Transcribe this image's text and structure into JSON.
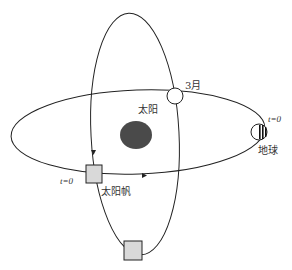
{
  "diagram": {
    "type": "orbit-diagram",
    "labels": {
      "march": "3月",
      "sun": "太阳",
      "t0_earth": "t=0",
      "earth": "地球",
      "t0_sail": "t=0",
      "solar_sail": "太阳帆"
    },
    "colors": {
      "sun": "#4a4a4a",
      "sail_box": "#d9d9d9",
      "orbit_line": "#222222",
      "earth_stripes": "#111111"
    },
    "elements": [
      {
        "name": "earth-orbit",
        "shape": "ellipse"
      },
      {
        "name": "sail-orbit",
        "shape": "ellipse"
      },
      {
        "name": "sun",
        "shape": "filled-ellipse"
      },
      {
        "name": "earth-march-position",
        "shape": "open-circle"
      },
      {
        "name": "earth-t0-position",
        "shape": "striped-circle"
      },
      {
        "name": "sail-t0-position",
        "shape": "gray-square"
      },
      {
        "name": "sail-bottom-position",
        "shape": "gray-square"
      }
    ]
  }
}
